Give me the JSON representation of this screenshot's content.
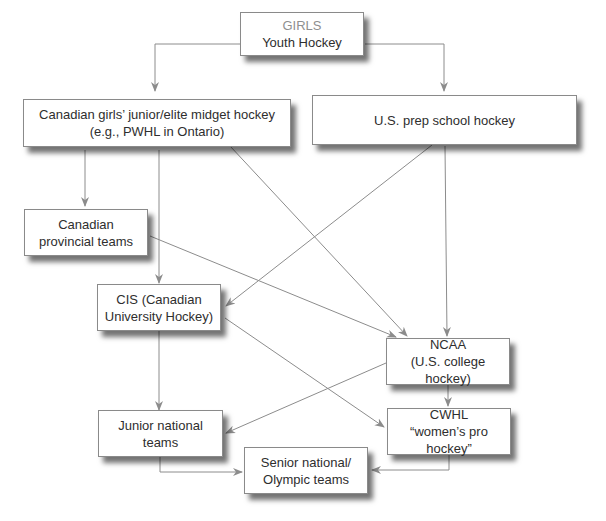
{
  "diagram": {
    "type": "flowchart",
    "edge_color": "#8c8c8c",
    "nodes": {
      "youth": {
        "line1": "GIRLS",
        "line2": "Youth Hockey"
      },
      "cdn_junior": {
        "line1": "Canadian girls’ junior/elite midget hockey",
        "line2": "(e.g., PWHL in Ontario)"
      },
      "us_prep": {
        "line1": "U.S. prep school hockey"
      },
      "provincial": {
        "line1": "Canadian",
        "line2": "provincial teams"
      },
      "cis": {
        "line1": "CIS (Canadian",
        "line2": "University Hockey)"
      },
      "ncaa": {
        "line1": "NCAA",
        "line2": "(U.S. college hockey)"
      },
      "junior_national": {
        "line1": "Junior national teams"
      },
      "cwhl": {
        "line1": "CWHL",
        "line2": "“women’s pro hockey”"
      },
      "senior": {
        "line1": "Senior national/",
        "line2": "Olympic teams"
      }
    },
    "edges": [
      [
        "youth",
        "cdn_junior"
      ],
      [
        "youth",
        "us_prep"
      ],
      [
        "cdn_junior",
        "provincial"
      ],
      [
        "cdn_junior",
        "cis"
      ],
      [
        "cdn_junior",
        "ncaa"
      ],
      [
        "us_prep",
        "cis"
      ],
      [
        "us_prep",
        "ncaa"
      ],
      [
        "provincial",
        "ncaa"
      ],
      [
        "cis",
        "junior_national"
      ],
      [
        "cis",
        "cwhl"
      ],
      [
        "ncaa",
        "junior_national"
      ],
      [
        "ncaa",
        "cwhl"
      ],
      [
        "junior_national",
        "senior"
      ],
      [
        "cwhl",
        "senior"
      ]
    ]
  }
}
